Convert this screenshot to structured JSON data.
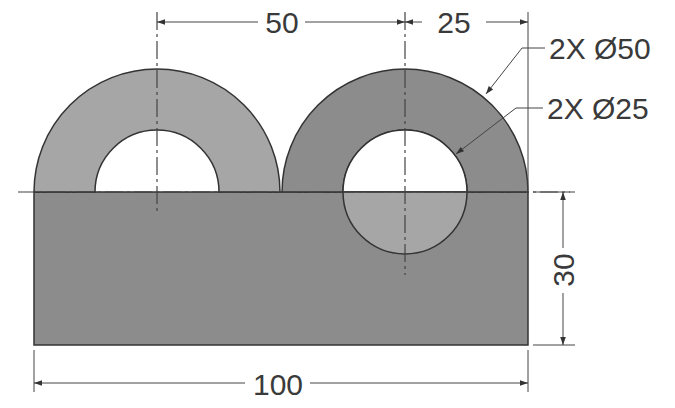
{
  "drawing": {
    "type": "engineering-drawing",
    "colors": {
      "background": "#ffffff",
      "light_fill": "#a6a6a6",
      "dark_fill": "#8c8c8c",
      "outline": "#333333",
      "dimension_line": "#444444",
      "text": "#3a3a3a"
    },
    "dimensions": {
      "horizontal_top_left": "50",
      "horizontal_top_right": "25",
      "vertical_right": "30",
      "horizontal_bottom": "100"
    },
    "callouts": {
      "outer_diameter": "2X Ø50",
      "inner_diameter": "2X Ø25"
    },
    "features": [
      {
        "name": "base-block",
        "width": 100,
        "height": 30
      },
      {
        "name": "left-boss",
        "outer_diameter": 50,
        "inner_diameter": 25,
        "shading": "light"
      },
      {
        "name": "right-boss",
        "outer_diameter": 50,
        "inner_diameter": 25,
        "shading": "dark"
      }
    ]
  }
}
